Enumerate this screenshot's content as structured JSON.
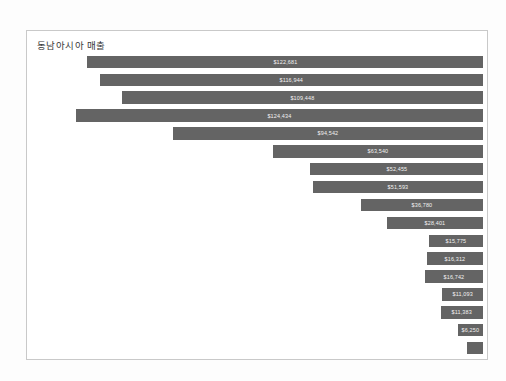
{
  "chart_data": {
    "type": "bar",
    "orientation": "horizontal",
    "title": "동남아시아 매출",
    "xlabel": "",
    "ylabel": "",
    "grid": false,
    "legend": false,
    "bar_color": "#646464",
    "label_color": "#f2f2f2",
    "background": "#ffffff",
    "border_color": "#c9c9c9",
    "alignment": "right-aligned",
    "value_prefix": "$",
    "xlim": [
      0,
      135000
    ],
    "categories": [
      "bar-1",
      "bar-2",
      "bar-3",
      "bar-4",
      "bar-5",
      "bar-6",
      "bar-7",
      "bar-8",
      "bar-9",
      "bar-10",
      "bar-11",
      "bar-12",
      "bar-13",
      "bar-14",
      "bar-15",
      "bar-16",
      "bar-17"
    ],
    "values": [
      122681,
      116944,
      109448,
      124434,
      94542,
      63540,
      52455,
      51593,
      36780,
      28401,
      15775,
      16312,
      16742,
      11093,
      11383,
      6250,
      3100
    ],
    "labels": [
      "$122,681",
      "$116,944",
      "$109,448",
      "$124,434",
      "$94,542",
      "$63,540",
      "$52,455",
      "$51,593",
      "$36,780",
      "$28,401",
      "$15,775",
      "$16,312",
      "$16,742",
      "$11,093",
      "$11,383",
      "$6,250",
      ""
    ],
    "bar_lengths_px": [
      396,
      383,
      361,
      407,
      310,
      210,
      173,
      170,
      122,
      96,
      54,
      56,
      58,
      41,
      42,
      25,
      16
    ]
  }
}
